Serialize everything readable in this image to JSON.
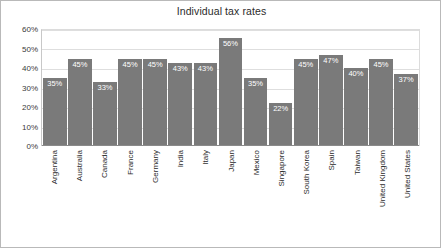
{
  "chart_data": {
    "type": "bar",
    "title": "Individual tax rates",
    "xlabel": "",
    "ylabel": "",
    "ylim": [
      0,
      60
    ],
    "ytick_labels": [
      "60%",
      "50%",
      "40%",
      "30%",
      "20%",
      "10%",
      "0%"
    ],
    "ytick_values": [
      60,
      50,
      40,
      30,
      20,
      10,
      0
    ],
    "grid": true,
    "legend": false,
    "bar_color": "#7a7a7a",
    "data_label_color": "#ffffff",
    "categories": [
      "Argentina",
      "Australia",
      "Canada",
      "France",
      "Germany",
      "India",
      "Italy",
      "Japan",
      "Mexico",
      "Singapore",
      "South Korea",
      "Spain",
      "Taiwan",
      "United Kingdom",
      "United States"
    ],
    "values": [
      35,
      45,
      33,
      45,
      45,
      43,
      43,
      56,
      35,
      22,
      45,
      47,
      40,
      45,
      37
    ],
    "data_labels": [
      "35%",
      "45%",
      "33%",
      "45%",
      "45%",
      "43%",
      "43%",
      "56%",
      "35%",
      "22%",
      "45%",
      "47%",
      "40%",
      "45%",
      "37%"
    ]
  }
}
